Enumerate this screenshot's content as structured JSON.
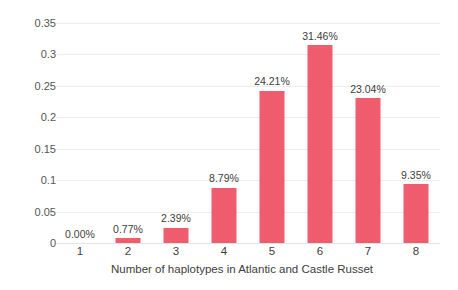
{
  "chart_data": {
    "type": "bar",
    "title": "",
    "xlabel": "Number of haplotypes in Atlantic and Castle Russet",
    "ylabel": "",
    "categories": [
      "1",
      "2",
      "3",
      "4",
      "5",
      "6",
      "7",
      "8"
    ],
    "values": [
      0.0,
      0.0077,
      0.0239,
      0.0879,
      0.2421,
      0.3146,
      0.2304,
      0.0935
    ],
    "data_labels": [
      "0.00%",
      "0.77%",
      "2.39%",
      "8.79%",
      "24.21%",
      "31.46%",
      "23.04%",
      "9.35%"
    ],
    "ylim": [
      0,
      0.35
    ],
    "ytick_labels": [
      "0",
      "0.05",
      "0.1",
      "0.15",
      "0.2",
      "0.25",
      "0.3",
      "0.35"
    ],
    "ytick_values": [
      0,
      0.05,
      0.1,
      0.15,
      0.2,
      0.25,
      0.3,
      0.35
    ],
    "grid": true,
    "legend": "none",
    "bar_color": "#ef5c6e",
    "gridline_color": "#ededed",
    "background_color": "#ffffff"
  }
}
